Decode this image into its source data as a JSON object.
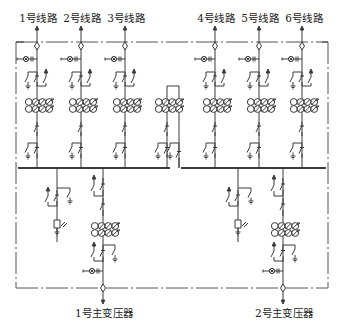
{
  "diagram": {
    "title": "",
    "colors": {
      "line": "#3a3a3a",
      "border": "#555555",
      "background": "#ffffff"
    },
    "feeder_labels": [
      {
        "text": "1号线路",
        "x": 38
      },
      {
        "text": "2号线路",
        "x": 82
      },
      {
        "text": "3号线路",
        "x": 126
      },
      {
        "text": "4号线路",
        "x": 216
      },
      {
        "text": "5号线路",
        "x": 260
      },
      {
        "text": "6号线路",
        "x": 304
      }
    ],
    "transformer_labels": [
      {
        "text": "1号主变压器",
        "x": 104
      },
      {
        "text": "2号主变压器",
        "x": 284
      }
    ],
    "feeders_x": [
      37,
      81,
      125,
      215,
      259,
      302
    ],
    "bus_tie_x": 167,
    "bus_sections": [
      {
        "name": "I段母线",
        "x1": 18,
        "x2": 170,
        "y": 168
      },
      {
        "name": "II段母线",
        "x1": 181,
        "x2": 326,
        "y": 168
      }
    ],
    "incomers": [
      {
        "name": "1号主变进线",
        "x": 103,
        "pt_x": 57
      },
      {
        "name": "2号主变进线",
        "x": 283,
        "pt_x": 238
      }
    ],
    "border": {
      "x1": 16,
      "y1": 42,
      "x2": 328,
      "y2": 288
    },
    "symbols": [
      "feeder-arrow-icon",
      "cable-sealing-end-icon",
      "live-indicator-icon",
      "earthing-switch-icon",
      "disconnector-icon",
      "current-transformer-icon",
      "surge-arrester-icon",
      "voltage-transformer-icon"
    ]
  }
}
